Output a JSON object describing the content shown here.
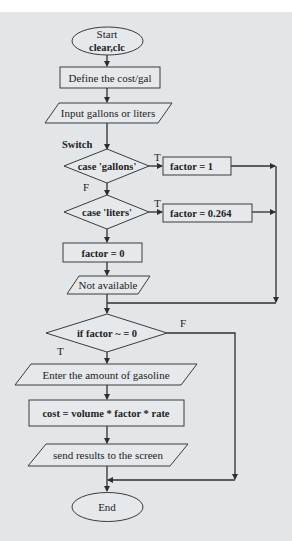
{
  "diagram": {
    "type": "flowchart",
    "background": "#e3e6e9",
    "line_color": "#2e2e2e",
    "nodes": {
      "start": {
        "shape": "terminal",
        "line1": "Start",
        "line2": "clear,clc"
      },
      "define": {
        "shape": "process",
        "label": "Define the cost/gal"
      },
      "input": {
        "shape": "io",
        "label": "Input gallons or liters"
      },
      "switch_label": "Switch",
      "case_gallons": {
        "shape": "decision",
        "label": "case 'gallons'"
      },
      "factor_1": {
        "shape": "process",
        "label": "factor = 1"
      },
      "case_liters": {
        "shape": "decision",
        "label": "case 'liters'"
      },
      "factor_0264": {
        "shape": "process",
        "label": "factor = 0.264"
      },
      "factor_0": {
        "shape": "process",
        "label": "factor = 0"
      },
      "not_available": {
        "shape": "io",
        "label": "Not available"
      },
      "if_factor": {
        "shape": "decision",
        "label": "if factor ~ = 0"
      },
      "enter_amount": {
        "shape": "io",
        "label": "Enter the amount of gasoline"
      },
      "cost": {
        "shape": "process",
        "label": "cost = volume * factor * rate"
      },
      "send_results": {
        "shape": "io",
        "label": "send results to the screen"
      },
      "end": {
        "shape": "terminal",
        "label": "End"
      }
    },
    "edge_labels": {
      "gallons_true": "T",
      "gallons_false": "F",
      "liters_true": "T",
      "if_true": "T",
      "if_false": "F"
    },
    "edges": [
      [
        "start",
        "define"
      ],
      [
        "define",
        "input"
      ],
      [
        "input",
        "case_gallons"
      ],
      [
        "case_gallons",
        "factor_1",
        "T"
      ],
      [
        "case_gallons",
        "case_liters",
        "F"
      ],
      [
        "case_liters",
        "factor_0264",
        "T"
      ],
      [
        "case_liters",
        "factor_0"
      ],
      [
        "factor_1",
        "if_factor"
      ],
      [
        "factor_0264",
        "if_factor"
      ],
      [
        "factor_0",
        "not_available"
      ],
      [
        "not_available",
        "if_factor"
      ],
      [
        "if_factor",
        "enter_amount",
        "T"
      ],
      [
        "if_factor",
        "end",
        "F"
      ],
      [
        "enter_amount",
        "cost"
      ],
      [
        "cost",
        "send_results"
      ],
      [
        "send_results",
        "end"
      ]
    ]
  }
}
